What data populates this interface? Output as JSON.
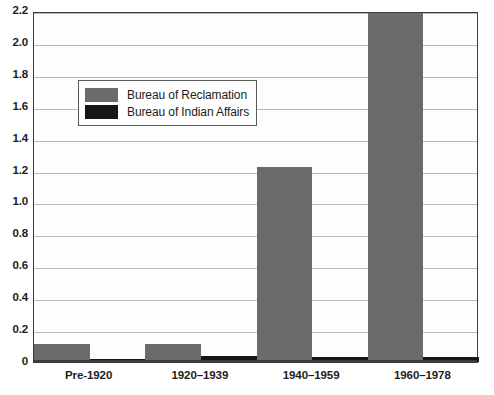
{
  "chart_data": {
    "type": "bar",
    "title": "",
    "xlabel": "",
    "ylabel": "",
    "grid": true,
    "legend_position": "inside-upper-left",
    "categories": [
      "Pre-1920",
      "1920–1939",
      "1940–1959",
      "1960–1978"
    ],
    "ylim": [
      0,
      2.2
    ],
    "ytick_labels": [
      "2.2",
      "2.0",
      "1.8",
      "1.6",
      "1.4",
      "1.2",
      "1.0",
      "0.8",
      "0.6",
      "0.4",
      "0.2",
      "0"
    ],
    "ytick_values": [
      2.2,
      2.0,
      1.8,
      1.6,
      1.4,
      1.2,
      1.0,
      0.8,
      0.6,
      0.4,
      0.2,
      0
    ],
    "series": [
      {
        "name": "Bureau of Reclamation",
        "color": "#6b6b6b",
        "values": [
          0.115,
          0.11,
          1.22,
          2.19
        ]
      },
      {
        "name": "Bureau of Indian Affairs",
        "color": "#161616",
        "values": [
          0.02,
          0.04,
          0.03,
          0.03
        ]
      }
    ]
  },
  "legend": {
    "entries": [
      {
        "label": "Bureau of Reclamation",
        "color": "#6b6b6b"
      },
      {
        "label": "Bureau of Indian Affairs",
        "color": "#161616"
      }
    ]
  }
}
